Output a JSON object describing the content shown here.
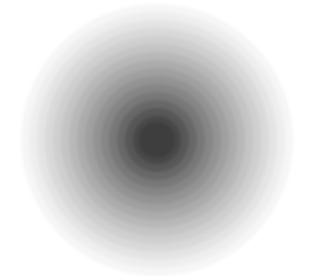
{
  "image": {
    "description": "Concentric circles radial gradient, dark gray center fading to white",
    "center": [
      157,
      140
    ],
    "rings": [
      {
        "r": 136,
        "color": "#f6f6f6"
      },
      {
        "r": 128,
        "color": "#eeeeee"
      },
      {
        "r": 120,
        "color": "#e4e4e4"
      },
      {
        "r": 112,
        "color": "#d9d9d9"
      },
      {
        "r": 104,
        "color": "#cfcfcf"
      },
      {
        "r": 96,
        "color": "#c4c4c4"
      },
      {
        "r": 88,
        "color": "#b8b8b8"
      },
      {
        "r": 80,
        "color": "#acacac"
      },
      {
        "r": 72,
        "color": "#a0a0a0"
      },
      {
        "r": 64,
        "color": "#939393"
      },
      {
        "r": 56,
        "color": "#868686"
      },
      {
        "r": 48,
        "color": "#787878"
      },
      {
        "r": 40,
        "color": "#686868"
      },
      {
        "r": 32,
        "color": "#575757"
      },
      {
        "r": 24,
        "color": "#484848"
      },
      {
        "r": 18,
        "color": "#3e3e3e"
      }
    ]
  }
}
